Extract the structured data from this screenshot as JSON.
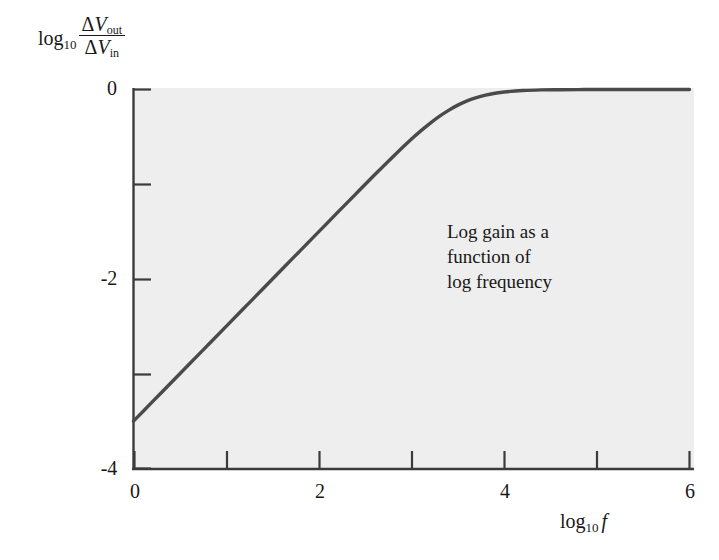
{
  "figure": {
    "background_color": "#ffffff",
    "plot_background_color": "#eeeeee",
    "axis_color": "#3b3b3b",
    "curve_color": "#4a4a4a"
  },
  "annotation": {
    "line1": "Log gain as a",
    "line2": "function of",
    "line3": "log frequency"
  },
  "ylabel": {
    "log": "log",
    "base": "10",
    "numerator_delta": "Δ",
    "numerator_var": "V",
    "numerator_sub": "out",
    "denominator_delta": "Δ",
    "denominator_var": "V",
    "denominator_sub": "in"
  },
  "xlabel": {
    "log": "log",
    "base": "10",
    "var": "f"
  },
  "ticks": {
    "y_labels": [
      "0",
      "-2",
      "-4"
    ],
    "x_labels": [
      "0",
      "2",
      "4",
      "6"
    ]
  },
  "chart_data": {
    "type": "line",
    "title": "",
    "subtitle": "",
    "xlabel": "log10 f",
    "ylabel": "log10 (dVout / dVin)",
    "xlim": [
      0,
      6
    ],
    "ylim": [
      -4,
      0
    ],
    "xticks": [
      0,
      1,
      2,
      3,
      4,
      5,
      6
    ],
    "xticklabels": [
      "0",
      "",
      "2",
      "",
      "4",
      "",
      "6"
    ],
    "yticks": [
      0,
      -1,
      -2,
      -3,
      -4
    ],
    "yticklabels": [
      "0",
      "",
      "-2",
      "",
      "-4"
    ],
    "grid": false,
    "legend": null,
    "annotations": [
      {
        "text": "Log gain as a function of log frequency",
        "x": 3.4,
        "y": -1.45
      }
    ],
    "corner_frequency_log10": 3.5,
    "low_frequency_slope": 1,
    "high_frequency_asymptote": 0,
    "series": [
      {
        "name": "log gain",
        "x": [
          0.0,
          0.2,
          0.4,
          0.6,
          0.8,
          1.0,
          1.2,
          1.4,
          1.6,
          1.8,
          2.0,
          2.2,
          2.4,
          2.6,
          2.8,
          3.0,
          3.1,
          3.2,
          3.3,
          3.4,
          3.5,
          3.6,
          3.7,
          3.8,
          3.9,
          4.0,
          4.2,
          4.4,
          4.6,
          4.8,
          5.0,
          5.5,
          6.0
        ],
        "y": [
          -3.5,
          -3.3,
          -3.1,
          -2.9,
          -2.7,
          -2.5,
          -2.3,
          -2.1,
          -1.9,
          -1.7,
          -1.5,
          -1.3,
          -1.101,
          -0.903,
          -0.709,
          -0.523,
          -0.437,
          -0.357,
          -0.284,
          -0.22,
          -0.165,
          -0.12,
          -0.085,
          -0.059,
          -0.04,
          -0.026,
          -0.011,
          -0.004,
          -0.002,
          -0.001,
          0.0,
          0.0,
          0.0
        ]
      }
    ]
  }
}
